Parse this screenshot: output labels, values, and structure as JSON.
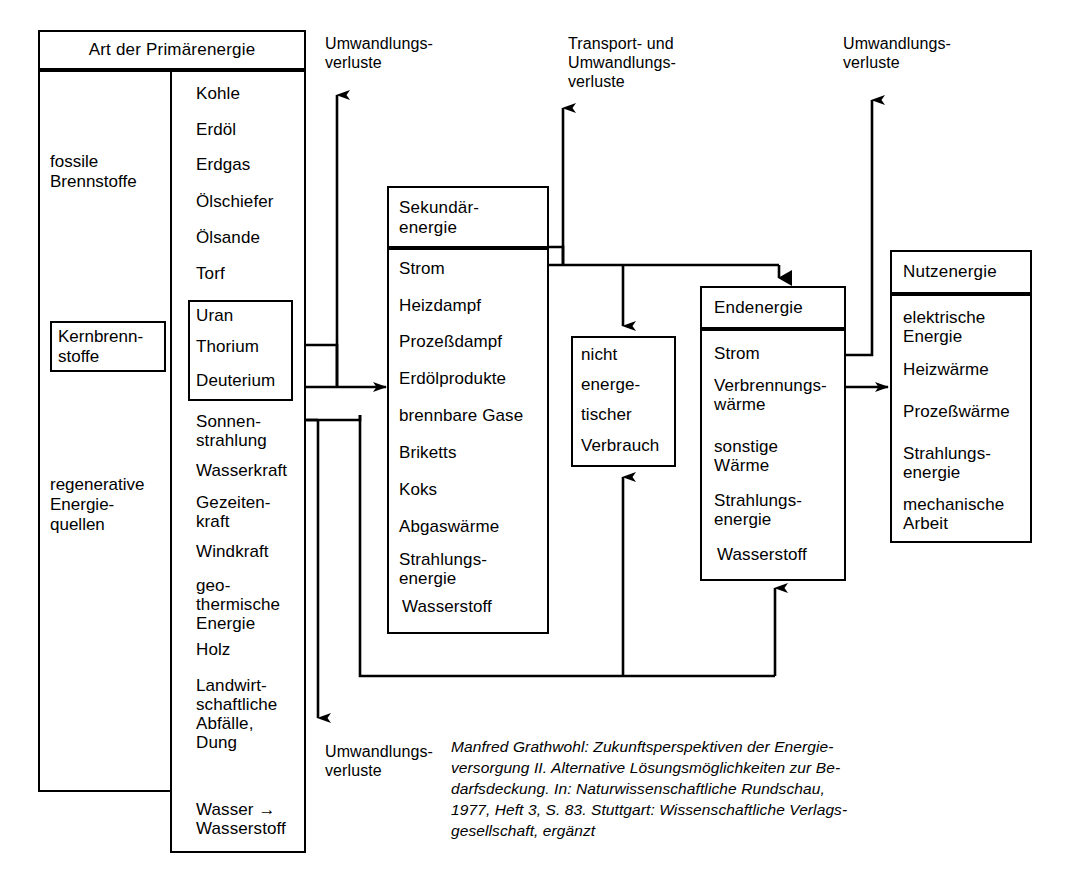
{
  "diagram": {
    "title_text": "Energieflussdiagramm",
    "primary": {
      "header": "Art der Primärenergie",
      "categories": [
        {
          "name": "fossile\nBrennstoffe",
          "boxed": false
        },
        {
          "name": "Kernbrenn-\nstoffe",
          "boxed": true
        },
        {
          "name": "regenerative\nEnergie-\nquellen",
          "boxed": false
        }
      ],
      "items": [
        "Kohle",
        "Erdöl",
        "Erdgas",
        "Ölschiefer",
        "Ölsande",
        "Torf",
        "Uran",
        "Thorium",
        "Deuterium",
        "Sonnen-\nstrahlung",
        "Wasserkraft",
        "Gezeiten-\nkraft",
        "Windkraft",
        "geo-\nthermische\nEnergie",
        "Holz",
        "Landwirt-\nschaftliche\nAbfälle,\nDung",
        "Wasser →\nWasserstoff"
      ]
    },
    "secondary": {
      "header": "Sekundär-\nenergie",
      "items": [
        "Strom",
        "Heizdampf",
        "Prozeßdampf",
        "Erdölprodukte",
        "brennbare Gase",
        "Briketts",
        "Koks",
        "Abgaswärme",
        "Strahlungs-\nenergie",
        "Wasserstoff"
      ]
    },
    "nonenergetic": {
      "lines": [
        "nicht",
        "energe-",
        "tischer",
        "Verbrauch"
      ]
    },
    "final": {
      "header": "Endenergie",
      "items": [
        "Strom",
        "Verbrennungs-\nwärme",
        "sonstige\nWärme",
        "Strahlungs-\nenergie",
        "Wasserstoff"
      ]
    },
    "useful": {
      "header": "Nutzenergie",
      "items": [
        "elektrische\nEnergie",
        "Heizwärme",
        "Prozeßwärme",
        "Strahlungs-\nenergie",
        "mechanische\nArbeit"
      ]
    },
    "loss_labels": {
      "top_left": "Umwandlungs-\nverluste",
      "top_middle": "Transport- und\nUmwandlungs-\nverluste",
      "top_right": "Umwandlungs-\nverluste",
      "bottom_left": "Umwandlungs-\nverluste"
    },
    "caption": "Manfred Grathwohl: Zukunftsperspektiven der Energie-\nversorgung II. Alternative Lösungsmöglichkeiten zur Be-\ndarfsdeckung. In: Naturwissenschaftliche Rundschau,\n1977, Heft 3, S. 83. Stuttgart: Wissenschaftliche Verlags-\ngesellschaft, ergänzt",
    "colors": {
      "ink": "#000000",
      "paper": "#ffffff"
    }
  }
}
